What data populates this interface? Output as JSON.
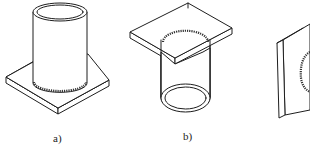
{
  "figures": [
    {
      "id": "a",
      "label": "a)",
      "description": "tube standing on square plate with circumferential fillet weld at base"
    },
    {
      "id": "b",
      "label": "b)",
      "description": "square plate on top with tube hanging below, weld at plate-tube junction"
    },
    {
      "id": "c",
      "label": "",
      "description": "vertical plate with tube attached (partially cropped)"
    }
  ],
  "colors": {
    "line": "#1e1e1e",
    "background": "#ffffff"
  }
}
